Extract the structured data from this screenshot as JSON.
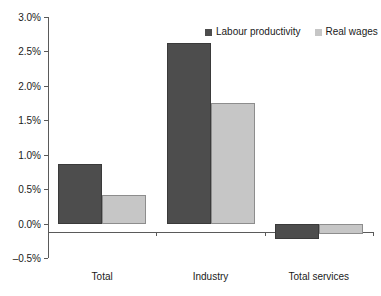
{
  "chart_data": {
    "type": "bar",
    "title": "",
    "subtitle": "",
    "xlabel": "",
    "ylabel": "",
    "categories": [
      "Total",
      "Industry",
      "Total services"
    ],
    "series": [
      {
        "name": "Labour productivity",
        "color": "#4d4d4d",
        "values": [
          0.87,
          2.62,
          -0.23
        ]
      },
      {
        "name": "Real wages",
        "color": "#c6c6c6",
        "values": [
          0.41,
          1.75,
          -0.15
        ]
      }
    ],
    "ylim": [
      -0.5,
      3.0
    ],
    "ytick_values": [
      3.0,
      2.5,
      2.0,
      1.5,
      1.0,
      0.5,
      0.0,
      -0.5
    ],
    "ytick_labels": [
      "3.0%",
      "2.5%",
      "2.0%",
      "1.5%",
      "1.0%",
      "0.5%",
      "0.0%",
      "-0.5%"
    ],
    "grid": false,
    "legend_position": "top-right",
    "axis_color": "#5a5a5a",
    "background": "#ffffff"
  },
  "legend": {
    "entries": [
      {
        "label": "Labour productivity"
      },
      {
        "label": "Real wages"
      }
    ]
  }
}
